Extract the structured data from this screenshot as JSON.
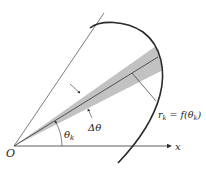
{
  "diagram": {
    "type": "polar-area-element",
    "labels": {
      "origin": "O",
      "x_axis": "x",
      "angle": "θ",
      "angle_sub": "k",
      "delta_angle": "Δθ",
      "radius_r": "r",
      "radius_sub": "k",
      "radius_eq": " = f(θ",
      "radius_eq_sub": "k",
      "radius_eq_close": ")"
    },
    "colors": {
      "line": "#333333",
      "wedge": "#c0c0c0",
      "curve": "#2a2a2a",
      "background": "#ffffff"
    }
  }
}
